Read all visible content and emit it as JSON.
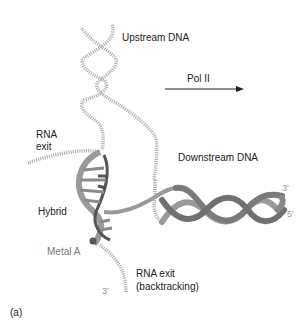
{
  "figure": {
    "panel_label": "(a)",
    "labels": {
      "upstream_dna": "Upstream DNA",
      "pol_ii": "Pol II",
      "rna_exit_line1": "RNA",
      "rna_exit_line2": "exit",
      "downstream_dna": "Downstream DNA",
      "hybrid": "Hybrid",
      "metal_a": "Metal A",
      "rna_exit_backtracking_line1": "RNA exit",
      "rna_exit_backtracking_line2": "(backtracking)",
      "downstream_3prime": "3'",
      "downstream_5prime": "5'",
      "rna_3prime": "3'"
    },
    "colors": {
      "dashed_strand": "#a8a8a8",
      "helix_dark": "#707070",
      "helix_light": "#9a9a9a",
      "rna_strand": "#555555",
      "text": "#222222",
      "arrow": "#222222"
    }
  }
}
